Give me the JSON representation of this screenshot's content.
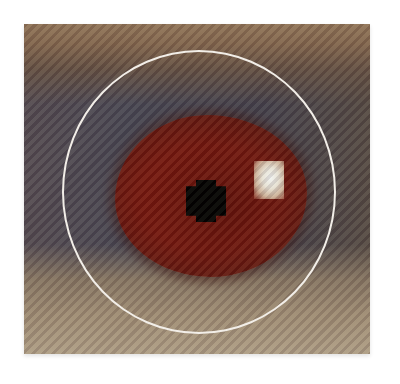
{
  "image": {
    "description": "Pixelated close-up of an eye showing red-eye effect, with a white circle highlighting the iris",
    "colors": {
      "iris_red": "#7a1810",
      "pupil": "#050202",
      "highlight": "#ffffff",
      "ring": "#f2eee8",
      "skin_top": "#9a7a5e",
      "skin_bottom": "#b8a48c",
      "sclera_shadow": "#4e4a58"
    }
  }
}
